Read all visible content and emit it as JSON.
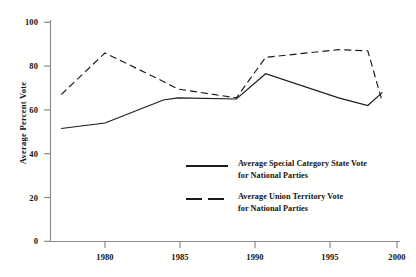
{
  "chart_data": {
    "type": "line",
    "title": "",
    "xlabel": "",
    "ylabel": "Average Percent Vote",
    "xlim": [
      1977,
      2000
    ],
    "ylim": [
      0,
      100
    ],
    "yticks": [
      0,
      20,
      40,
      60,
      80,
      100
    ],
    "xticks": [
      1980,
      1985,
      1990,
      1995,
      2000
    ],
    "grid": false,
    "legend_position": "center",
    "series": [
      {
        "name": "Average Special Category State Vote for National Parties",
        "style": "solid",
        "color": "#1a1a1a",
        "x": [
          1977,
          1980,
          1984,
          1985,
          1989,
          1991,
          1996,
          1998,
          1999
        ],
        "values": [
          51.5,
          54.0,
          64.5,
          65.5,
          65.0,
          76.5,
          65.5,
          62.0,
          68.0
        ]
      },
      {
        "name": "Average Union Territory Vote for National Parties",
        "style": "dashed",
        "color": "#1a1a1a",
        "x": [
          1977,
          1980,
          1984,
          1985,
          1989,
          1991,
          1996,
          1998,
          1999
        ],
        "values": [
          67.0,
          86.0,
          73.0,
          69.5,
          65.5,
          84.0,
          87.5,
          87.0,
          63.5
        ]
      }
    ],
    "ytick_labels": [
      "0",
      "20",
      "40",
      "60",
      "80",
      "100"
    ],
    "xtick_labels": [
      "1980",
      "1985",
      "1990",
      "1995",
      "2000"
    ]
  },
  "legend": {
    "entries": [
      {
        "line1": "Average Special Category State Vote",
        "line2": "for National Parties",
        "style": "solid"
      },
      {
        "line1": "Average Union Territory Vote",
        "line2": "for National Parties",
        "style": "dashed"
      }
    ]
  },
  "axis": {
    "y_title": "Average Percent Vote"
  },
  "colors": {
    "line": "#1a1a1a",
    "axis": "#808080",
    "text": "#141414",
    "background": "#fffffe"
  }
}
